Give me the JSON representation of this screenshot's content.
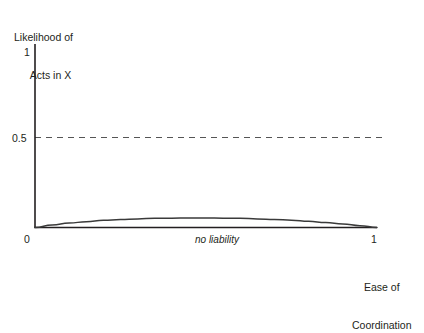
{
  "chart_data": {
    "type": "line",
    "title": "",
    "ylabel_lines": [
      "Likelihood of",
      "Acts in X"
    ],
    "xlabel_lines": [
      "Ease of",
      "Coordination"
    ],
    "xlabel": "Ease of Coordination",
    "ylabel": "Likelihood of Acts in X",
    "xlim": [
      0,
      1
    ],
    "ylim": [
      0,
      1
    ],
    "xticks": [
      "0",
      "1"
    ],
    "yticks": [
      "0",
      "0.5",
      "1"
    ],
    "grid": false,
    "legend": null,
    "annotations": [
      {
        "text": "no liability",
        "x": 0.53,
        "y": 0.0,
        "style": "italic",
        "position": "below-axis"
      }
    ],
    "reference_lines": [
      {
        "axis": "y",
        "value": 0.5,
        "style": "dashed",
        "color": "#555555",
        "label": "0.5"
      }
    ],
    "series": [
      {
        "name": "no liability",
        "color": "#3a3a3a",
        "x": [
          0.0,
          0.05,
          0.1,
          0.15,
          0.2,
          0.25,
          0.3,
          0.35,
          0.4,
          0.45,
          0.5,
          0.55,
          0.6,
          0.65,
          0.7,
          0.75,
          0.8,
          0.85,
          0.9,
          0.95,
          1.0
        ],
        "values": [
          0.0,
          0.014,
          0.024,
          0.032,
          0.039,
          0.044,
          0.047,
          0.05,
          0.051,
          0.052,
          0.052,
          0.051,
          0.05,
          0.047,
          0.044,
          0.04,
          0.034,
          0.027,
          0.019,
          0.01,
          0.0
        ]
      }
    ]
  },
  "ticks": {
    "y_top": "1",
    "y_mid": "0.5",
    "x_left": "0",
    "x_right": "1"
  },
  "axis_titles": {
    "y_line1": "Likelihood of",
    "y_line2": "Acts in X",
    "x_line1": "Ease of",
    "x_line2": "Coordination"
  },
  "annotation": {
    "no_liability": "no liability"
  },
  "colors": {
    "axis": "#231f20",
    "curve": "#3a3a3a",
    "dashed": "#555555",
    "background": "#ffffff",
    "text": "#231f20"
  }
}
